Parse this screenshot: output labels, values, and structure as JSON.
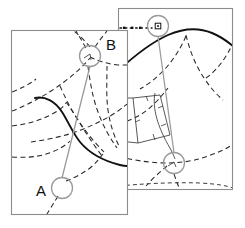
{
  "figure": {
    "title": "",
    "background_color": "#ffffff",
    "width": 245,
    "height": 228
  },
  "colors": {
    "panel_border": "#8c8c8c",
    "panel_fill": "#ffffff",
    "dashed_network": "#262626",
    "thick_route": "#111111",
    "marker_gray": "#9a9a9a",
    "parcel_line": "#3a3a3a",
    "text": "#111111"
  },
  "panels": [
    {
      "name": "left-map-panel",
      "x": 11,
      "y": 30,
      "width": 117,
      "height": 185
    },
    {
      "name": "right-map-panel",
      "x": 118,
      "y": 8,
      "width": 115,
      "height": 182
    }
  ],
  "labels": [
    {
      "id": "label-b",
      "text": "B",
      "x": 106,
      "y": 50
    },
    {
      "id": "label-a",
      "text": "A",
      "x": 42,
      "y": 196
    }
  ],
  "markers": [
    {
      "id": "marker-b",
      "label": "B",
      "cx": 90,
      "cy": 56,
      "r": 10.5,
      "panel": "left-map-panel"
    },
    {
      "id": "marker-a",
      "label": "A",
      "cx": 62,
      "cy": 188,
      "r": 10.5,
      "panel": "left-map-panel"
    },
    {
      "id": "marker-node-top",
      "label": "",
      "cx": 158,
      "cy": 26,
      "r": 10.5,
      "panel": "right-map-panel"
    },
    {
      "id": "marker-node-bottom",
      "label": "",
      "cx": 174,
      "cy": 163,
      "r": 10.5,
      "panel": "right-map-panel"
    }
  ],
  "connectors": [
    {
      "id": "connector-b-to-a",
      "from": "marker-b",
      "to": "marker-a"
    },
    {
      "id": "connector-node-top-to-bottom",
      "from": "marker-node-top",
      "to": "marker-node-bottom"
    }
  ],
  "leader": {
    "id": "leader-dotted-line",
    "style": "dotted",
    "from_x": 120,
    "from_y": 28,
    "to_x": 152,
    "to_y": 28,
    "node_square_size": 5
  },
  "legend": {
    "visible": false,
    "entries": []
  }
}
